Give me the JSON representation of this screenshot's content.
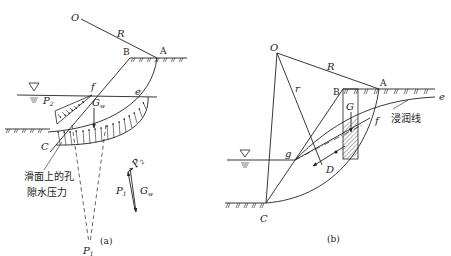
{
  "figure_a": {
    "caption": "(a)",
    "labels": {
      "O": "O",
      "R": "R",
      "B": "B",
      "A": "A",
      "f": "f",
      "e": "e",
      "C": "C",
      "P2": "P",
      "P2_sub": "2",
      "Gw": "G",
      "Gw_sub": "w",
      "P1": "P",
      "P1_sub": "1",
      "force_P1": "P",
      "force_P1_sub": "1",
      "force_P2": "P",
      "force_P2_sub": "2",
      "force_Gw": "G",
      "force_Gw_sub": "w"
    },
    "annotation_line1": "滑面上的孔",
    "annotation_line2": "隙水压力"
  },
  "figure_b": {
    "caption": "(b)",
    "labels": {
      "O": "O",
      "R": "R",
      "r": "r",
      "B": "B",
      "A": "A",
      "G": "G",
      "f": "f",
      "e": "e",
      "g": "g",
      "D": "D",
      "C": "C"
    },
    "annotation": "浸润线"
  },
  "colors": {
    "line": "#222222",
    "background": "#ffffff"
  }
}
